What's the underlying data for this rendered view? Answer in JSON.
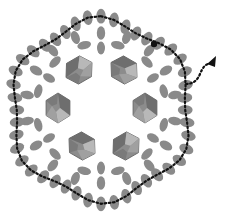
{
  "diagram": {
    "type": "beadwork-pattern",
    "colors": {
      "background": "#ffffff",
      "seed_bead": "#8a8a8a",
      "crystal_dark": "#6e6e6e",
      "crystal_mid": "#8c8c8c",
      "crystal_light": "#b8b8b8",
      "thread": "#111111"
    },
    "center": [
      101,
      108
    ],
    "crystals": [
      {
        "name": "crystal-top-left",
        "x": 79,
        "y": 70,
        "rot": -30
      },
      {
        "name": "crystal-top-right",
        "x": 124,
        "y": 70,
        "rot": 30
      },
      {
        "name": "crystal-right",
        "x": 145,
        "y": 108,
        "rot": 90
      },
      {
        "name": "crystal-bottom-right",
        "x": 126,
        "y": 146,
        "rot": -30
      },
      {
        "name": "crystal-bottom-left",
        "x": 82,
        "y": 146,
        "rot": 30
      },
      {
        "name": "crystal-left",
        "x": 58,
        "y": 108,
        "rot": 90
      }
    ],
    "thread": {
      "start_knot": [
        154,
        44
      ],
      "end_arrow": [
        213,
        62
      ]
    },
    "visible_text": []
  }
}
